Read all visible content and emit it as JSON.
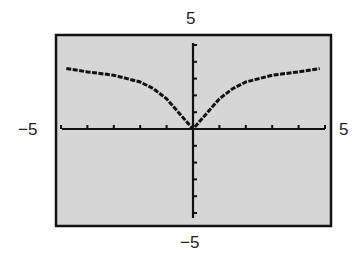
{
  "chart_data": {
    "type": "line",
    "title": "",
    "xlabel": "",
    "ylabel": "",
    "xlim": [
      -5,
      5
    ],
    "ylim": [
      -5,
      5
    ],
    "grid": false,
    "legend": null,
    "tick_labels": {
      "x_min": "−5",
      "x_max": "5",
      "y_min": "−5",
      "y_max": "5"
    },
    "ticks_per_unit": 1,
    "series": [
      {
        "name": "f(x)",
        "x": [
          -4.8,
          -4,
          -3,
          -2.5,
          -2,
          -1.5,
          -1,
          -0.5,
          0,
          0.5,
          1,
          1.5,
          2,
          2.5,
          3,
          4,
          4.8
        ],
        "y": [
          3.6,
          3.4,
          3.2,
          3.0,
          2.8,
          2.4,
          1.8,
          0.9,
          0,
          0.9,
          1.8,
          2.4,
          2.8,
          3.0,
          3.2,
          3.4,
          3.6
        ]
      }
    ]
  },
  "colors": {
    "plot_bg": "#d6d6d6",
    "frame": "#111111",
    "curve": "#111111"
  }
}
